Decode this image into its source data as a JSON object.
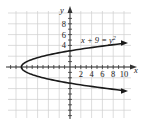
{
  "chart_data": {
    "type": "line",
    "title": "",
    "equation_label": "x + 9 = y²",
    "equation_parts": {
      "lhs": "x + 9 = y",
      "exp": "2"
    },
    "xlabel": "x",
    "ylabel": "y",
    "x_tick_labels": [
      "2",
      "4",
      "6",
      "8",
      "10"
    ],
    "y_tick_labels": [
      "8",
      "6",
      "4"
    ],
    "xlim": [
      -12,
      11
    ],
    "ylim": [
      -9,
      10
    ],
    "grid": true,
    "grid_step": 2,
    "series": [
      {
        "name": "x + 9 = y²",
        "function": "x = y^2 - 9",
        "points": [
          {
            "x": 12,
            "y": 4.6
          },
          {
            "x": 7,
            "y": 4
          },
          {
            "x": 0,
            "y": 3
          },
          {
            "x": -5,
            "y": 2
          },
          {
            "x": -8,
            "y": 1
          },
          {
            "x": -9,
            "y": 0
          },
          {
            "x": -8,
            "y": -1
          },
          {
            "x": -5,
            "y": -2
          },
          {
            "x": 0,
            "y": -3
          },
          {
            "x": 7,
            "y": -4
          },
          {
            "x": 12,
            "y": -4.6
          }
        ],
        "arrows": "both ends",
        "color": "#1a1a1a"
      }
    ]
  },
  "colors": {
    "grid": "#cfcfcf",
    "axis": "#333333",
    "curve": "#1a1a1a"
  }
}
